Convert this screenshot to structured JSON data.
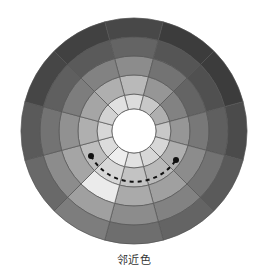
{
  "diagram": {
    "title": "",
    "caption": "邻近色",
    "wheel": {
      "center": [
        134,
        131
      ],
      "ring_radii": [
        22,
        37,
        56,
        75,
        94,
        113
      ],
      "segment_count": 12,
      "start_angle_deg": -15,
      "stroke_color": "#555555",
      "hole_color": "#ffffff",
      "grays_by_segment_inner_to_outer": [
        [
          220,
          185,
          140,
          100,
          72
        ],
        [
          200,
          150,
          115,
          85,
          60
        ],
        [
          175,
          130,
          100,
          80,
          60
        ],
        [
          200,
          150,
          120,
          95,
          75
        ],
        [
          215,
          175,
          140,
          115,
          90
        ],
        [
          215,
          185,
          160,
          130,
          100
        ],
        [
          225,
          195,
          170,
          140,
          110
        ],
        [
          238,
          215,
          235,
          160,
          125
        ],
        [
          220,
          190,
          165,
          140,
          105
        ],
        [
          215,
          175,
          145,
          115,
          90
        ],
        [
          210,
          165,
          125,
          95,
          70
        ],
        [
          225,
          175,
          130,
          90,
          65
        ]
      ]
    },
    "adjacent_arc": {
      "label": "adjacent colors",
      "radius": 50,
      "from_deg": 238,
      "to_deg": 126,
      "dash": "4 4",
      "color": "#111111",
      "endpoints": [
        [
          91,
          156
        ],
        [
          176,
          160
        ]
      ]
    }
  }
}
